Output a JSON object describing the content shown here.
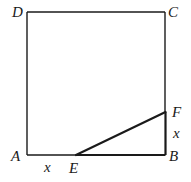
{
  "figure": {
    "type": "square with inscribed right triangle",
    "colors": {
      "stroke": "#1a1a1a",
      "background": "#ffffff"
    },
    "vertices": {
      "A": "A",
      "B": "B",
      "C": "C",
      "D": "D",
      "E": "E",
      "F": "F"
    },
    "segment_labels": {
      "AE": "x",
      "BF": "x"
    },
    "segments": [
      {
        "from": "A",
        "to": "B",
        "name": "side-ab"
      },
      {
        "from": "B",
        "to": "C",
        "name": "side-bc"
      },
      {
        "from": "C",
        "to": "D",
        "name": "side-cd"
      },
      {
        "from": "D",
        "to": "A",
        "name": "side-da"
      },
      {
        "from": "E",
        "to": "F",
        "name": "segment-ef",
        "bold": true
      },
      {
        "from": "E",
        "to": "B",
        "name": "segment-eb",
        "bold": true
      },
      {
        "from": "B",
        "to": "F",
        "name": "segment-bf",
        "bold": true
      }
    ]
  }
}
